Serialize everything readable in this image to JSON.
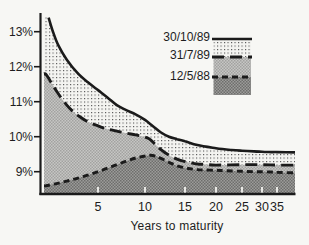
{
  "figure": {
    "x_axis_title": "Years to maturity",
    "y_tick_labels": [
      "13%",
      "12%",
      "11%",
      "10%",
      "9%"
    ],
    "x_tick_labels": [
      "5",
      "10",
      "15",
      "20",
      "25",
      "30",
      "35"
    ]
  },
  "chart_data": {
    "type": "area",
    "title": "",
    "xlabel": "Years to maturity",
    "ylabel": "Yield (%)",
    "xlim": [
      0,
      38
    ],
    "ylim": [
      8.4,
      13.5
    ],
    "x_ticks": [
      5,
      10,
      15,
      20,
      25,
      30,
      35
    ],
    "y_ticks": [
      9,
      10,
      11,
      12,
      13
    ],
    "grid": false,
    "legend_position": "top-right",
    "series": [
      {
        "name": "30/10/89",
        "line_style": "solid",
        "fill": "dots",
        "points": [
          [
            0.25,
            13.4
          ],
          [
            0.7,
            12.97
          ],
          [
            1.2,
            12.6
          ],
          [
            2,
            12.2
          ],
          [
            3,
            11.83
          ],
          [
            4,
            11.56
          ],
          [
            5,
            11.33
          ],
          [
            6,
            11.12
          ],
          [
            7,
            10.9
          ],
          [
            8,
            10.76
          ],
          [
            9,
            10.64
          ],
          [
            10,
            10.48
          ],
          [
            11,
            10.3
          ],
          [
            12,
            10.12
          ],
          [
            13,
            10.0
          ],
          [
            14,
            9.93
          ],
          [
            15,
            9.87
          ],
          [
            17,
            9.76
          ],
          [
            20,
            9.67
          ],
          [
            23,
            9.62
          ],
          [
            25,
            9.6
          ],
          [
            28,
            9.58
          ],
          [
            30,
            9.57
          ],
          [
            33,
            9.56
          ],
          [
            35,
            9.56
          ],
          [
            38,
            9.55
          ]
        ]
      },
      {
        "name": "31/7/89",
        "line_style": "long-dash",
        "fill": "light-halftone",
        "points": [
          [
            0,
            11.78
          ],
          [
            0.6,
            11.5
          ],
          [
            1.2,
            11.22
          ],
          [
            2,
            10.9
          ],
          [
            2.6,
            10.72
          ],
          [
            3.2,
            10.58
          ],
          [
            4,
            10.43
          ],
          [
            5,
            10.31
          ],
          [
            6,
            10.22
          ],
          [
            7,
            10.16
          ],
          [
            8,
            10.1
          ],
          [
            9,
            10.05
          ],
          [
            10,
            9.99
          ],
          [
            10.6,
            9.93
          ],
          [
            11.3,
            9.78
          ],
          [
            12,
            9.63
          ],
          [
            13,
            9.47
          ],
          [
            14,
            9.36
          ],
          [
            15,
            9.29
          ],
          [
            16,
            9.25
          ],
          [
            17,
            9.22
          ],
          [
            18,
            9.21
          ],
          [
            20,
            9.19
          ],
          [
            25,
            9.2
          ],
          [
            30,
            9.2
          ],
          [
            35,
            9.19
          ],
          [
            38,
            9.19
          ]
        ]
      },
      {
        "name": "12/5/88",
        "line_style": "short-dash",
        "fill": "dark-halftone",
        "points": [
          [
            0,
            8.6
          ],
          [
            1,
            8.66
          ],
          [
            2,
            8.73
          ],
          [
            3,
            8.81
          ],
          [
            4,
            8.9
          ],
          [
            5,
            9.0
          ],
          [
            6,
            9.1
          ],
          [
            7,
            9.2
          ],
          [
            8,
            9.3
          ],
          [
            9,
            9.39
          ],
          [
            10,
            9.45
          ],
          [
            10.7,
            9.47
          ],
          [
            11.4,
            9.44
          ],
          [
            12,
            9.38
          ],
          [
            13,
            9.27
          ],
          [
            14,
            9.17
          ],
          [
            15,
            9.11
          ],
          [
            16,
            9.08
          ],
          [
            17,
            9.06
          ],
          [
            18,
            9.05
          ],
          [
            20,
            9.04
          ],
          [
            22,
            9.03
          ],
          [
            25,
            9.01
          ],
          [
            28,
            9.0
          ],
          [
            30,
            9.0
          ],
          [
            33,
            8.99
          ],
          [
            35,
            8.98
          ],
          [
            38,
            8.97
          ]
        ]
      }
    ],
    "colors": {
      "line": "#1b1b1b",
      "axis": "#1b1b1b",
      "dots_bg": "#f4f4f1",
      "dots_fg": "#4c4c4c",
      "mid_bg": "#c6c6c4",
      "mid_fg": "#a2a2a0",
      "dark_bg": "#9c9c9a",
      "dark_fg": "#6e6e6c",
      "x_tick_mark": "#f3f3f0"
    },
    "layout": {
      "x_anchor_px": [
        [
          0,
          46
        ],
        [
          5,
          98
        ],
        [
          10,
          145
        ],
        [
          15,
          185
        ],
        [
          20,
          216
        ],
        [
          25,
          242
        ],
        [
          30,
          262
        ],
        [
          35,
          277
        ],
        [
          38,
          295
        ]
      ],
      "y_ref": [
        [
          9,
          171.7
        ],
        [
          13,
          31.7
        ]
      ],
      "plot": {
        "left": 44,
        "right": 295,
        "top": 13,
        "bottom": 193.5,
        "axis_x": 40.5,
        "axis_y": 194
      },
      "legend": {
        "swatch_left": 213.5,
        "swatch_width": 37.5,
        "row_y": [
          39,
          57,
          77,
          95
        ],
        "line_x1": 212,
        "line_x2": 252
      }
    }
  }
}
